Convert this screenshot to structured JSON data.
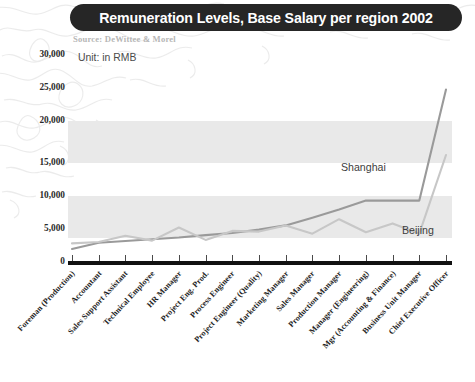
{
  "header": {
    "title": "Remuneration Levels, Base Salary per region 2002",
    "source": "Source: DeWittee & Morel",
    "unit": "Unit: in RMB"
  },
  "annotations": {
    "shanghai_label": "Shanghai",
    "beijing_label": "Beijing"
  },
  "colors": {
    "title_bar": "#262626",
    "title_text": "#ffffff",
    "band": "#e9e9e9",
    "shanghai_line": "#9a9a9a",
    "beijing_line": "#c4c4c4",
    "axis": "#111111",
    "map_outline": "#dcdcdc"
  },
  "chart_data": {
    "type": "line",
    "title": "Remuneration Levels, Base Salary per region 2002",
    "subtitle": "Source: DeWittee & Morel",
    "xlabel": "",
    "ylabel": "Unit: in RMB",
    "ylim": [
      0,
      30000
    ],
    "yticks": [
      0,
      5000,
      10000,
      15000,
      20000,
      25000,
      30000
    ],
    "ytick_labels": [
      "0",
      "5,000",
      "10,000",
      "15,000",
      "20,000",
      "25,000",
      "30,000"
    ],
    "grid": false,
    "bands": [
      {
        "from": 5000,
        "to": 10000
      },
      {
        "from": 15000,
        "to": 20000
      }
    ],
    "legend_position": "inline-annotation",
    "categories": [
      "Foreman (Production)",
      "Accountant",
      "Sales Support Assistant",
      "Technical Employee",
      "HR Manager",
      "Project Eng. Prod.",
      "Process Engineer",
      "Project Engineer (Quality)",
      "Marketing Manager",
      "Sales Manager",
      "Production Manager",
      "Manager (Engineering)",
      "Mgr (Accounting & Finance)",
      "Business Unit Manager",
      "Chief Executive Officer"
    ],
    "series": [
      {
        "name": "Shanghai",
        "color": "#9a9a9a",
        "values": [
          1900,
          2800,
          3050,
          3300,
          3550,
          3900,
          4200,
          4700,
          5300,
          6400,
          7600,
          8900,
          8900,
          8900,
          25000
        ]
      },
      {
        "name": "Beijing",
        "color": "#c4c4c4",
        "values": [
          2700,
          2900,
          3800,
          3100,
          5000,
          3200,
          4500,
          4400,
          5300,
          4100,
          6200,
          4300,
          5600,
          4100,
          15500
        ]
      }
    ]
  }
}
